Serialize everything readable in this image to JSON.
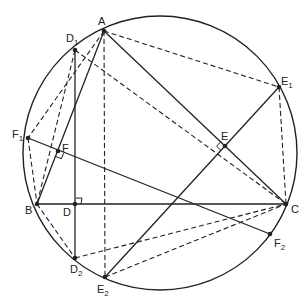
{
  "diagram": {
    "title": "",
    "circle": {
      "cx": 160,
      "cy": 153,
      "r": 137
    },
    "points": {
      "A": {
        "x": 104,
        "y": 31,
        "label": "A",
        "sub": "",
        "lx": 98,
        "ly": 25
      },
      "B": {
        "x": 37,
        "y": 204,
        "label": "B",
        "sub": "",
        "lx": 25,
        "ly": 214
      },
      "C": {
        "x": 286,
        "y": 204,
        "label": "C",
        "sub": "",
        "lx": 291,
        "ly": 213
      },
      "D": {
        "x": 75,
        "y": 204,
        "label": "D",
        "sub": "",
        "lx": 63,
        "ly": 216
      },
      "E": {
        "x": 225,
        "y": 146,
        "label": "E",
        "sub": "",
        "lx": 221,
        "ly": 140
      },
      "F": {
        "x": 58,
        "y": 151,
        "label": "F",
        "sub": "",
        "lx": 62,
        "ly": 152
      },
      "D1": {
        "x": 75,
        "y": 50,
        "label": "D",
        "sub": "1",
        "lx": 66,
        "ly": 42
      },
      "D2": {
        "x": 75,
        "y": 258,
        "label": "D",
        "sub": "2",
        "lx": 70,
        "ly": 273
      },
      "E1": {
        "x": 279,
        "y": 87,
        "label": "E",
        "sub": "1",
        "lx": 281,
        "ly": 85
      },
      "E2": {
        "x": 105,
        "y": 277,
        "label": "E",
        "sub": "2",
        "lx": 97,
        "ly": 293
      },
      "F1": {
        "x": 28,
        "y": 138,
        "label": "F",
        "sub": "1",
        "lx": 12,
        "ly": 138
      },
      "F2": {
        "x": 270,
        "y": 234,
        "label": "F",
        "sub": "2",
        "lx": 274,
        "ly": 247
      }
    },
    "solid_segments": [
      [
        "A",
        "B"
      ],
      [
        "A",
        "C"
      ],
      [
        "B",
        "C"
      ],
      [
        "D1",
        "D2"
      ],
      [
        "F1",
        "F2"
      ],
      [
        "E2",
        "E1"
      ]
    ],
    "dashed_segments": [
      [
        "A",
        "E2"
      ],
      [
        "A",
        "E1"
      ],
      [
        "E1",
        "C"
      ],
      [
        "A",
        "F1"
      ],
      [
        "D1",
        "B"
      ],
      [
        "D1",
        "C"
      ],
      [
        "F1",
        "B"
      ],
      [
        "B",
        "D2"
      ],
      [
        "D2",
        "C"
      ],
      [
        "E2",
        "C"
      ]
    ],
    "right_angles": [
      {
        "at": "D",
        "note": "AD ⊥ BC"
      },
      {
        "at": "E",
        "note": "BE ⊥ AC"
      },
      {
        "at": "F",
        "note": "CF ⊥ AB"
      }
    ],
    "colors": {
      "stroke": "#222222",
      "background": "#ffffff"
    }
  }
}
